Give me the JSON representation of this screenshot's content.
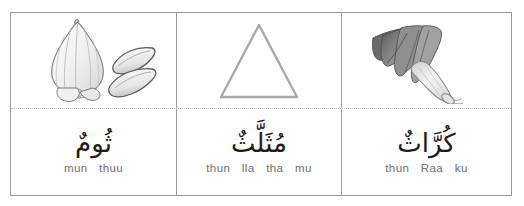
{
  "sheet": {
    "title": "Arabic vocabulary flashcard row",
    "border_color": "#9a9a9a",
    "divider_color": "#bdbdbd"
  },
  "cells": [
    {
      "id": "garlic",
      "picture": {
        "icon_name": "garlic-bulb-illustration",
        "description": "Pencil sketch of a garlic bulb with two separated cloves",
        "colors": {
          "outline": "#6b6b6b",
          "fill": "#f2f2f2",
          "shade": "#cfcfcf"
        }
      },
      "arabic": "ثُومٌ",
      "transliteration_parts": [
        "mun",
        "thuu"
      ],
      "transliteration": "mun thuu"
    },
    {
      "id": "triangle",
      "picture": {
        "icon_name": "triangle-shape",
        "description": "Outlined equilateral triangle",
        "colors": {
          "outline": "#a8a8a8",
          "fill": "#ffffff",
          "shade": "#a8a8a8"
        }
      },
      "arabic": "مُثَلَّثٌ",
      "transliteration_parts": [
        "thun",
        "lla",
        "tha",
        "mu"
      ],
      "transliteration": "thun lla tha mu"
    },
    {
      "id": "leek",
      "picture": {
        "icon_name": "leek-illustration",
        "description": "Pencil sketch of a leek with fanned dark leaves and pale stalk",
        "colors": {
          "outline": "#555555",
          "fill": "#e8e8e8",
          "shade": "#8a8a8a"
        }
      },
      "arabic": "كُرَّاثٌ",
      "transliteration_parts": [
        "thun",
        "Raa",
        "ku"
      ],
      "transliteration": "thun Raa ku"
    }
  ]
}
